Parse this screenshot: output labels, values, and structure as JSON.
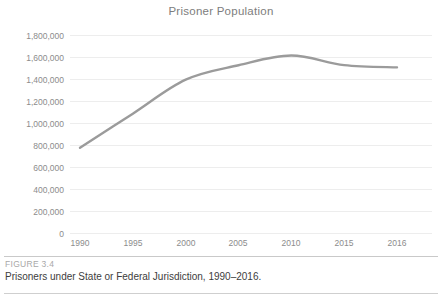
{
  "chart_data": {
    "type": "line",
    "title": "Prisoner Population",
    "xlabel": "",
    "ylabel": "",
    "categories": [
      "1990",
      "1995",
      "2000",
      "2005",
      "2010",
      "2015",
      "2016"
    ],
    "values": [
      774000,
      1085000,
      1394000,
      1525000,
      1613000,
      1526000,
      1506000
    ],
    "series": [
      {
        "name": "Prisoner Population",
        "values": [
          774000,
          1085000,
          1394000,
          1525000,
          1613000,
          1526000,
          1506000
        ],
        "color": "#9b9b9b"
      }
    ],
    "ylim": [
      0,
      1800000
    ],
    "ytick_values": [
      1800000,
      1600000,
      1400000,
      1200000,
      1000000,
      800000,
      600000,
      400000,
      200000,
      0
    ],
    "ytick_labels": [
      "1,800,000",
      "1,600,000",
      "1,400,000",
      "1,200,000",
      "1,000,000",
      "800,000",
      "600,000",
      "400,000",
      "200,000",
      "0"
    ],
    "xtick_labels": [
      "1990",
      "1995",
      "2000",
      "2005",
      "2010",
      "2015",
      "2016"
    ],
    "grid": "horizontal",
    "gridline_color": "#ededed",
    "legend": "none",
    "legend_position": "none",
    "line_color": "#9b9b9b",
    "markers": "none"
  },
  "figure": {
    "number_label": "FIGURE 3.4",
    "caption": "Prisoners under State or Federal Jurisdiction, 1990–2016."
  },
  "colors": {
    "background": "#ffffff",
    "title_text": "#7d7d7d",
    "tick_text": "#8c8c8c",
    "caption_text": "#3d3d3d",
    "figure_number_text": "#a8a8a8",
    "rule": "#c9c9c9",
    "line": "#9b9b9b",
    "gridline": "#ededed"
  }
}
